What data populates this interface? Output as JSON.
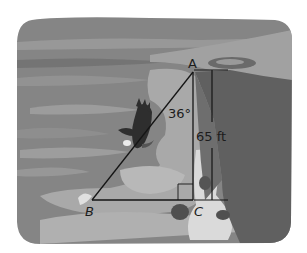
{
  "figure": {
    "vertices": {
      "A": {
        "label": "A"
      },
      "B": {
        "label": "B"
      },
      "C": {
        "label": "C"
      }
    },
    "angle_label": "36°",
    "height_label": "65 ft",
    "right_angle_at": "C"
  },
  "colors": {
    "background": "#ffffff",
    "sky_dark": "#7a7a7a",
    "sky_mid": "#8e8e8e",
    "sky_light": "#a8a8a8",
    "water": "#9a9a9a",
    "shore_light": "#c9c9c9",
    "cliff": "#5e5e5e",
    "line": "#151515"
  }
}
